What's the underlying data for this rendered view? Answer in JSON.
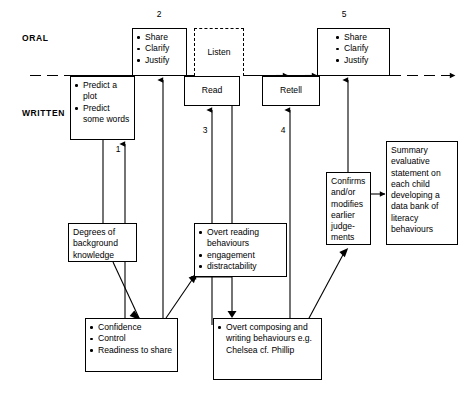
{
  "diagram": {
    "title_axis": {
      "oral_label": "ORAL",
      "written_label": "WRITTEN"
    },
    "step_numbers": {
      "one": "1",
      "two": "2",
      "three": "3",
      "four": "4",
      "five": "5"
    },
    "nodes": {
      "share_clarify_justify_2": {
        "items": [
          "Share",
          "Clarify",
          "Justify"
        ]
      },
      "listen": {
        "label": "Listen"
      },
      "share_clarify_justify_5": {
        "items": [
          "Share",
          "Clarify",
          "Justify"
        ]
      },
      "predict": {
        "items": [
          "Predict a plot",
          "Predict some words"
        ]
      },
      "read": {
        "label": "Read"
      },
      "retell": {
        "label": "Retell"
      },
      "confirms": {
        "text": "Confirms and/or modifies earlier judge-\nments"
      },
      "summary": {
        "text": "Summary evaluative statement on each child developing a data bank of literacy behaviours"
      },
      "degrees": {
        "text": "Degrees of background knowledge"
      },
      "overt_reading": {
        "items": [
          "Overt reading behaviours",
          "engagement",
          "distractability"
        ]
      },
      "confidence": {
        "items": [
          "Confidence",
          "Control",
          "Readiness to share"
        ]
      },
      "overt_composing": {
        "items": [
          "Overt composing and writing behaviours e.g. Chelsea cf. Phillip"
        ]
      }
    },
    "colors": {
      "line": "#000000",
      "background": "#ffffff"
    }
  }
}
